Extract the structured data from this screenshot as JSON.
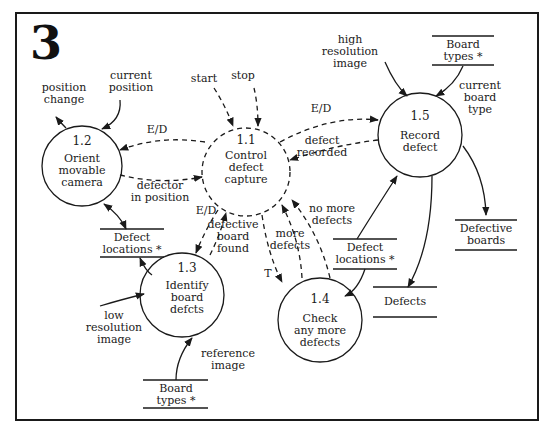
{
  "figure": {
    "number": "3"
  },
  "processes": [
    {
      "id": "1.1",
      "label": "Control\ndefect\ncapture",
      "style": "dashed"
    },
    {
      "id": "1.2",
      "label": "Orient\nmovable\ncamera",
      "style": "solid"
    },
    {
      "id": "1.3",
      "label": "Identify\nboard\ndefcts",
      "style": "solid"
    },
    {
      "id": "1.4",
      "label": "Check\nany more\ndefects",
      "style": "solid"
    },
    {
      "id": "1.5",
      "label": "Record\ndefect",
      "style": "solid"
    }
  ],
  "stores": {
    "board_types_top": "Board\ntypes *",
    "board_types_bottom": "Board\ntypes *",
    "defect_locations_left": "Defect\nlocations *",
    "defect_locations_right": "Defect\nlocations *",
    "defective_boards": "Defective\nboards",
    "defects": "Defects"
  },
  "flows": {
    "position_change": "position\nchange",
    "current_position": "current\nposition",
    "start": "start",
    "stop": "stop",
    "ed_12": "E/D",
    "ed_15": "E/D",
    "ed_13": "E/D",
    "defector_in_position": "defector\nin position",
    "defective_board_found": "defective\nboard\nfound",
    "more_defects": "more\ndefects",
    "no_more_defects": "no more\ndefects",
    "t": "T",
    "defect_recorded": "defect\nrecorded",
    "high_resolution_image": "high\nresolution\nimage",
    "current_board_type": "current\nboard\ntype",
    "low_resolution_image": "low\nresolution\nimage",
    "reference_image": "reference\nimage"
  },
  "colors": {
    "ink": "#1a1a1a",
    "background": "#ffffff"
  }
}
